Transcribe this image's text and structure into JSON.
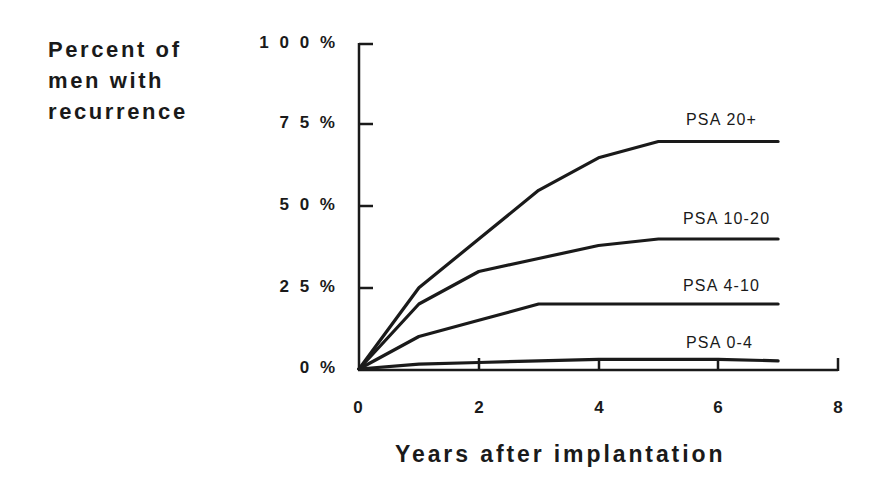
{
  "chart_data": {
    "type": "line",
    "title": "",
    "ylabel_lines": [
      "Percent of",
      "men with",
      "recurrence"
    ],
    "ylabel": "Percent of men with recurrence",
    "xlabel": "Years after implantation",
    "xlim": [
      0,
      8
    ],
    "ylim": [
      0,
      100
    ],
    "x_ticks": [
      "0",
      "2",
      "4",
      "6",
      "8"
    ],
    "y_ticks": [
      "100%",
      "75%",
      "50%",
      "25%",
      "0%"
    ],
    "grid": false,
    "legend": "inline labels at right end of each line",
    "x": [
      0,
      1,
      2,
      3,
      4,
      5,
      6,
      7
    ],
    "series": [
      {
        "name": "PSA 20+",
        "values": [
          0,
          25,
          40,
          55,
          65,
          70,
          70,
          70
        ]
      },
      {
        "name": "PSA 10-20",
        "values": [
          0,
          20,
          30,
          34,
          38,
          40,
          40,
          40
        ]
      },
      {
        "name": "PSA 4-10",
        "values": [
          0,
          10,
          15,
          20,
          20,
          20,
          20,
          20
        ]
      },
      {
        "name": "PSA 0-4",
        "values": [
          0,
          1.5,
          2,
          2.5,
          3,
          3,
          3,
          2.5
        ]
      }
    ]
  },
  "labels": {
    "y_ticks_display": [
      "1 0 0 %",
      "7 5 %",
      "5 0 %",
      "2 5 %",
      "0 %"
    ],
    "x_ticks_display": [
      "0",
      "2",
      "4",
      "6",
      "8"
    ]
  }
}
